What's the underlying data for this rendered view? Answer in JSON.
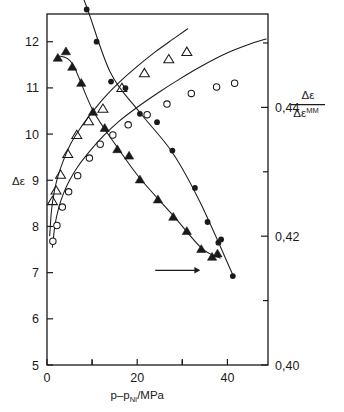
{
  "chart_data": {
    "type": "scatter",
    "title": "",
    "xlabel": "p−p_NI /MPa",
    "xlabel_parts": {
      "lead": "p–p",
      "sub": "NI",
      "tail": "/MPa"
    },
    "ylabel_left": "Δε",
    "ylabel_right_numerator": "Δε",
    "ylabel_right_denominator": "Δε",
    "ylabel_right_denominator_sup": "MM",
    "xlim": [
      0,
      49
    ],
    "ylim_left": [
      5,
      12.6
    ],
    "ylim_right": [
      0.4,
      0.4545
    ],
    "xticks": [
      0,
      10,
      20,
      30,
      40
    ],
    "xtick_labels": [
      "0",
      "",
      "20",
      "",
      "40"
    ],
    "yticks_left": [
      5,
      6,
      7,
      8,
      9,
      10,
      11,
      12
    ],
    "ytick_labels_left": [
      "5",
      "6",
      "7",
      "8",
      "9",
      "10",
      "11",
      "12"
    ],
    "yticks_right": [
      0.4,
      0.41,
      0.42,
      0.43,
      0.44,
      0.45,
      0.46
    ],
    "ytick_labels_right": [
      "0,40",
      "",
      "0,42",
      "",
      "0,44",
      "",
      "0,46"
    ],
    "grid": false,
    "legend": "none",
    "annotations": [
      {
        "name": "right-axis-arrow",
        "type": "arrow",
        "x_from": 24.0,
        "x_to": 34.0,
        "y": 7.05,
        "direction": "right"
      }
    ],
    "series": [
      {
        "name": "delta-epsilon-open-triangles",
        "marker": "open-triangle",
        "axis": "left",
        "points": [
          [
            1.2,
            8.55
          ],
          [
            2.0,
            8.78
          ],
          [
            3.0,
            9.12
          ],
          [
            4.6,
            9.57
          ],
          [
            6.6,
            9.98
          ],
          [
            9.2,
            10.28
          ],
          [
            12.4,
            10.55
          ],
          [
            16.6,
            11.0
          ],
          [
            21.6,
            11.32
          ],
          [
            27.0,
            11.62
          ],
          [
            31.0,
            11.78
          ]
        ]
      },
      {
        "name": "delta-epsilon-open-circles",
        "marker": "open-circle",
        "axis": "left",
        "points": [
          [
            1.3,
            7.68
          ],
          [
            2.2,
            8.02
          ],
          [
            3.4,
            8.42
          ],
          [
            4.8,
            8.75
          ],
          [
            6.8,
            9.1
          ],
          [
            9.4,
            9.48
          ],
          [
            11.8,
            9.78
          ],
          [
            14.6,
            9.98
          ],
          [
            18.0,
            10.2
          ],
          [
            22.2,
            10.42
          ],
          [
            26.6,
            10.65
          ],
          [
            32.0,
            10.88
          ],
          [
            37.6,
            11.02
          ],
          [
            41.6,
            11.1
          ]
        ]
      },
      {
        "name": "ratio-filled-circles",
        "marker": "filled-circle",
        "axis": "right",
        "points": [
          [
            1.2,
            0.46
          ],
          [
            3.0,
            0.4593
          ],
          [
            4.6,
            0.4595
          ],
          [
            6.6,
            0.4593
          ],
          [
            8.8,
            0.4552
          ],
          [
            11.0,
            0.4502
          ],
          [
            14.2,
            0.444
          ],
          [
            17.4,
            0.443
          ],
          [
            20.6,
            0.439
          ],
          [
            24.4,
            0.4377
          ],
          [
            27.8,
            0.4333
          ],
          [
            32.8,
            0.4275
          ],
          [
            35.6,
            0.4222
          ],
          [
            38.0,
            0.419
          ],
          [
            38.6,
            0.4195
          ],
          [
            41.2,
            0.4138
          ]
        ]
      },
      {
        "name": "ratio-filled-triangles",
        "marker": "filled-triangle",
        "axis": "right",
        "points": [
          [
            2.4,
            0.4477
          ],
          [
            4.2,
            0.4487
          ],
          [
            5.6,
            0.4463
          ],
          [
            7.6,
            0.4438
          ],
          [
            10.2,
            0.4393
          ],
          [
            12.8,
            0.4368
          ],
          [
            15.6,
            0.4335
          ],
          [
            18.2,
            0.4325
          ],
          [
            20.6,
            0.4288
          ],
          [
            24.6,
            0.4257
          ],
          [
            28.0,
            0.423
          ],
          [
            31.0,
            0.4208
          ],
          [
            34.2,
            0.418
          ],
          [
            36.6,
            0.4168
          ],
          [
            37.8,
            0.4173
          ]
        ]
      },
      {
        "name": "theory-curve-upper",
        "marker": "line",
        "axis": "left",
        "points": [
          [
            0.6,
            7.8
          ],
          [
            1.0,
            8.35
          ],
          [
            1.6,
            8.75
          ],
          [
            2.4,
            9.08
          ],
          [
            3.6,
            9.42
          ],
          [
            5.2,
            9.78
          ],
          [
            7.2,
            10.1
          ],
          [
            9.6,
            10.42
          ],
          [
            12.6,
            10.78
          ],
          [
            16.0,
            11.12
          ],
          [
            19.8,
            11.45
          ],
          [
            24.0,
            11.78
          ],
          [
            28.0,
            12.06
          ],
          [
            31.2,
            12.28
          ]
        ]
      },
      {
        "name": "theory-curve-lower",
        "marker": "line",
        "axis": "left",
        "points": [
          [
            1.2,
            7.55
          ],
          [
            1.8,
            8.05
          ],
          [
            2.6,
            8.4
          ],
          [
            3.6,
            8.7
          ],
          [
            5.0,
            9.0
          ],
          [
            7.0,
            9.32
          ],
          [
            9.4,
            9.62
          ],
          [
            12.4,
            9.95
          ],
          [
            16.0,
            10.28
          ],
          [
            20.0,
            10.58
          ],
          [
            24.4,
            10.88
          ],
          [
            29.2,
            11.18
          ],
          [
            34.4,
            11.48
          ],
          [
            39.8,
            11.75
          ],
          [
            45.0,
            11.95
          ],
          [
            48.6,
            12.06
          ]
        ]
      },
      {
        "name": "guide-line-filled-circles",
        "marker": "line",
        "axis": "right",
        "points": [
          [
            1.2,
            0.46
          ],
          [
            4.6,
            0.4596
          ],
          [
            8.0,
            0.457
          ],
          [
            14.0,
            0.4455
          ],
          [
            20.6,
            0.4392
          ],
          [
            27.8,
            0.433
          ],
          [
            34.0,
            0.4252
          ],
          [
            41.2,
            0.414
          ]
        ]
      },
      {
        "name": "guide-line-filled-triangles",
        "marker": "line",
        "axis": "right",
        "points": [
          [
            2.4,
            0.448
          ],
          [
            5.6,
            0.4468
          ],
          [
            10.2,
            0.4395
          ],
          [
            15.6,
            0.4338
          ],
          [
            20.6,
            0.429
          ],
          [
            28.0,
            0.4232
          ],
          [
            34.2,
            0.4182
          ],
          [
            38.4,
            0.4166
          ]
        ]
      }
    ]
  }
}
